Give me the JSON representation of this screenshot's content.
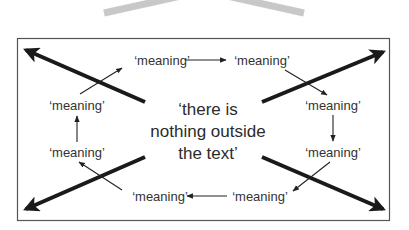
{
  "diagram": {
    "center_text": {
      "lines": [
        "‘there is",
        "nothing outside",
        "the text’"
      ]
    },
    "nodes": [
      {
        "id": "top-left",
        "label": "‘meaning’",
        "x": 162,
        "y": 60
      },
      {
        "id": "top-right",
        "label": "‘meaning’",
        "x": 262,
        "y": 60
      },
      {
        "id": "right-upper",
        "label": "‘meaning’",
        "x": 333,
        "y": 105
      },
      {
        "id": "right-lower",
        "label": "‘meaning’",
        "x": 333,
        "y": 152
      },
      {
        "id": "bottom-right",
        "label": "‘meaning’",
        "x": 260,
        "y": 196
      },
      {
        "id": "bottom-left",
        "label": "‘meaning’",
        "x": 160,
        "y": 196
      },
      {
        "id": "left-lower",
        "label": "‘meaning’",
        "x": 77,
        "y": 152
      },
      {
        "id": "left-upper",
        "label": "‘meaning’",
        "x": 77,
        "y": 105
      }
    ],
    "cycle_order": [
      "top-left",
      "top-right",
      "right-upper",
      "right-lower",
      "bottom-right",
      "bottom-left",
      "left-lower",
      "left-upper"
    ],
    "colors": {
      "border": "#555555",
      "thick_arrow": "#1a1a1a",
      "thin_arrow": "#222222",
      "chevron": "#c8c8c8",
      "text": "#333333"
    }
  }
}
